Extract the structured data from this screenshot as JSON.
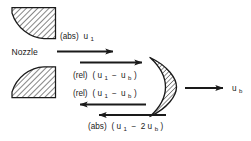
{
  "figure": {
    "type": "engineering-diagram",
    "background_color": "#ffffff",
    "ink_color": "#1a1a1a",
    "hatch_color": "#2b2b2b"
  },
  "labels": {
    "nozzle": "Nozzle",
    "abs_inlet": {
      "prefix": "(abs)",
      "expr_main": "u",
      "expr_sub": "1",
      "full": "(abs) u1"
    },
    "rel_inlet": {
      "prefix": "(rel)",
      "open_paren": "(",
      "v1": "u",
      "v1_sub": "1",
      "minus": "−",
      "v2": "u",
      "v2_sub": "b",
      "close_paren": ")",
      "full": "(rel) (u1 − ub)"
    },
    "rel_outlet": {
      "prefix": "(rel)",
      "open_paren": "(",
      "v1": "u",
      "v1_sub": "1",
      "minus": "−",
      "v2": "u",
      "v2_sub": "b",
      "close_paren": ")",
      "full": "(rel) (u1 − ub)"
    },
    "abs_outlet": {
      "prefix": "(abs)",
      "open_paren": "(",
      "v1": "u",
      "v1_sub": "1",
      "minus": "−",
      "coeff": "2",
      "v2": "u",
      "v2_sub": "b",
      "close_paren": ")",
      "full": "(abs) (u1 − 2ub)"
    },
    "bucket_speed": {
      "expr_main": "u",
      "expr_sub": "b",
      "full": "ub"
    }
  },
  "shapes": {
    "nozzle_upper": {
      "name": "upper-nozzle-quarter-circle",
      "hatched": true,
      "curve_side": "bottom-left"
    },
    "nozzle_lower": {
      "name": "lower-nozzle-quarter-circle",
      "hatched": true,
      "curve_side": "top-left"
    },
    "bucket": {
      "name": "pelton-bucket-crescent",
      "hatched": true,
      "opening": "left"
    }
  },
  "arrows": [
    {
      "name": "absolute-inlet-velocity-arrow",
      "direction": "right",
      "label_key": "abs_inlet"
    },
    {
      "name": "relative-inlet-velocity-arrow",
      "direction": "right",
      "label_key": "rel_inlet"
    },
    {
      "name": "relative-outlet-velocity-arrow",
      "direction": "left",
      "label_key": "rel_outlet"
    },
    {
      "name": "absolute-outlet-velocity-arrow",
      "direction": "left",
      "label_key": "abs_outlet"
    },
    {
      "name": "bucket-speed-arrow",
      "direction": "right",
      "label_key": "bucket_speed"
    }
  ]
}
